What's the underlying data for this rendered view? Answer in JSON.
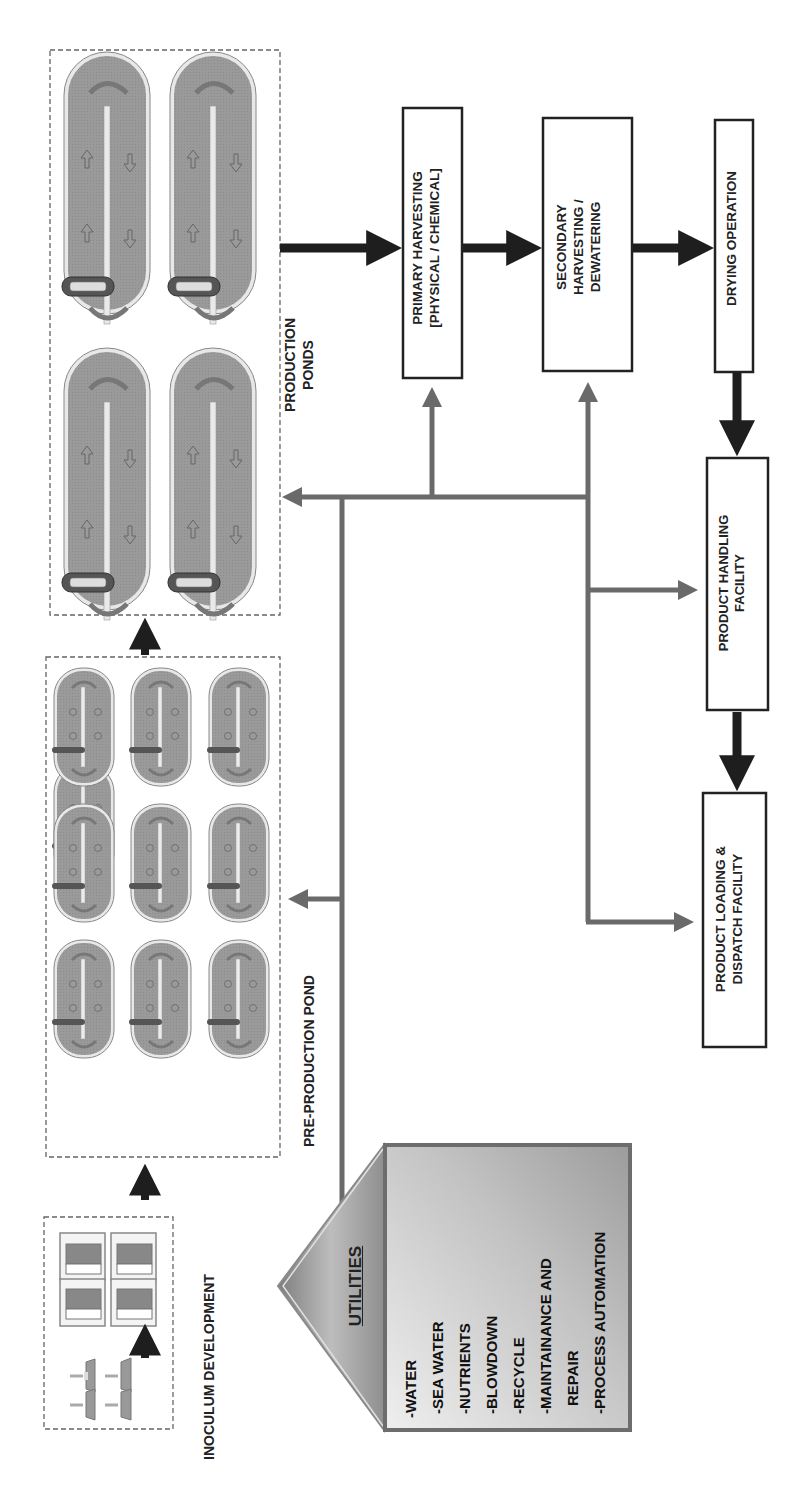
{
  "colors": {
    "pond_fill": "#9a9a9a",
    "pond_rim": "#e4e4e4",
    "main_flow_arrow": "#1e1e1e",
    "utility_line": "#6a6a6a",
    "box_border": "#222222",
    "utility_house_dark": "#8a8a8a",
    "utility_house_light": "#d8d8d8"
  },
  "sections": {
    "inoculum": {
      "label": "INOCULUM DEVELOPMENT",
      "flasks": 4,
      "incubators": 4
    },
    "pre_production": {
      "label": "PRE-PRODUCTION POND",
      "pond_count": 9,
      "rows": 3,
      "cols": 3
    },
    "production": {
      "label_line1": "PRODUCTION",
      "label_line2": "PONDS",
      "pond_count": 4
    }
  },
  "process_boxes": {
    "primary": {
      "line1": "PRIMARY HARVESTING",
      "line2": "[PHYSICAL / CHEMICAL]"
    },
    "secondary": {
      "line1": "SECONDARY",
      "line2": "HARVESTING /",
      "line3": "DEWATERING"
    },
    "drying": {
      "line1": "DRYING OPERATION"
    },
    "handling": {
      "line1": "PRODUCT HANDLING",
      "line2": "FACILITY"
    },
    "loading": {
      "line1": "PRODUCT LOADING &",
      "line2": "DISPATCH FACILITY"
    }
  },
  "utilities": {
    "title": "UTILITIES",
    "items": [
      "-WATER",
      "-SEA WATER",
      "-NUTRIENTS",
      "-BLOWDOWN",
      "-RECYCLE",
      "-MAINTAINANCE AND",
      "REPAIR",
      "-PROCESS AUTOMATION"
    ]
  }
}
